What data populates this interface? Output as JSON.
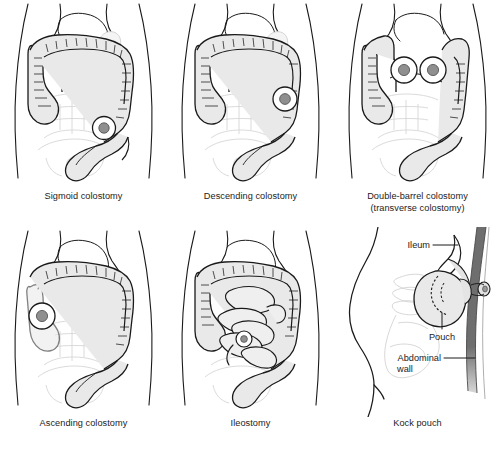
{
  "figure": {
    "background_color": "#ffffff",
    "line_color": "#1a1a1a",
    "organ_fill": "#e9e9e9",
    "faint_outline_color": "#d6d6d6",
    "stoma_center_color": "#8f8f8f",
    "abdominal_wall_color": "#6e6e6e"
  },
  "panels": [
    {
      "id": "sigmoid-colostomy",
      "caption": "Sigmoid colostomy",
      "caption_line2": "",
      "view": "anterior abdomen",
      "stoma_count": 1,
      "stoma_positions": [
        {
          "x": 104,
          "y": 128
        }
      ],
      "labels": []
    },
    {
      "id": "descending-colostomy",
      "caption": "Descending colostomy",
      "caption_line2": "",
      "view": "anterior abdomen",
      "stoma_count": 1,
      "stoma_positions": [
        {
          "x": 118,
          "y": 99
        }
      ],
      "labels": []
    },
    {
      "id": "double-barrel-colostomy",
      "caption": "Double-barrel colostomy",
      "caption_line2": "(transverse colostomy)",
      "view": "anterior abdomen",
      "stoma_count": 2,
      "stoma_positions": [
        {
          "x": 70,
          "y": 70
        },
        {
          "x": 98,
          "y": 70
        }
      ],
      "labels": []
    },
    {
      "id": "ascending-colostomy",
      "caption": "Ascending colostomy",
      "caption_line2": "",
      "view": "anterior abdomen",
      "stoma_count": 1,
      "stoma_positions": [
        {
          "x": 42,
          "y": 89
        }
      ],
      "labels": []
    },
    {
      "id": "ileostomy",
      "caption": "Ileostomy",
      "caption_line2": "",
      "view": "anterior abdomen",
      "stoma_count": 1,
      "stoma_positions": [
        {
          "x": 77,
          "y": 112
        }
      ],
      "labels": []
    },
    {
      "id": "kock-pouch",
      "caption": "Kock pouch",
      "caption_line2": "",
      "view": "lateral abdomen",
      "stoma_count": 1,
      "stoma_positions": [
        {
          "x": 133,
          "y": 48
        }
      ],
      "labels": [
        {
          "id": "ileum-label",
          "text": "Ileum",
          "text2": ""
        },
        {
          "id": "pouch-label",
          "text": "Pouch",
          "text2": ""
        },
        {
          "id": "abdominal-wall-label",
          "text": "Abdominal",
          "text2": "wall"
        }
      ]
    }
  ]
}
